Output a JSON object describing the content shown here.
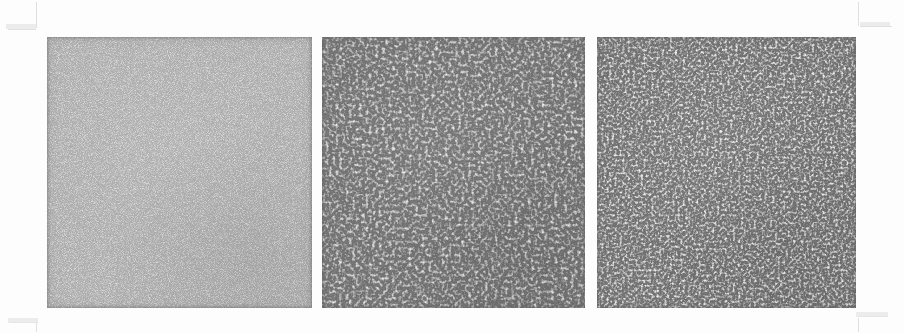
{
  "figure": {
    "background_color": "#fdfdfd",
    "width": 904,
    "height": 333
  },
  "panels": [
    {
      "id": "panel-1",
      "label": "",
      "texture": "fine-speckle-noise",
      "base_color": "#6b6b6b",
      "highlight_color": "#e8e8e8",
      "shadow_color": "#3a3a3a",
      "x": 47,
      "y": 37,
      "width": 265,
      "height": 271,
      "grain_scale": "fine",
      "feature_frequency": 0.62
    },
    {
      "id": "panel-2",
      "label": "",
      "texture": "labyrinthine-worm-pattern",
      "base_color": "#6d6d6d",
      "highlight_color": "#d8d8d8",
      "shadow_color": "#424242",
      "x": 322,
      "y": 37,
      "width": 263,
      "height": 271,
      "grain_scale": "coarse",
      "feature_frequency": 0.3
    },
    {
      "id": "panel-3",
      "label": "",
      "texture": "labyrinthine-worm-pattern",
      "base_color": "#6c6c6c",
      "highlight_color": "#dcdcdc",
      "shadow_color": "#3f3f3f",
      "x": 597,
      "y": 37,
      "width": 259,
      "height": 271,
      "grain_scale": "medium",
      "feature_frequency": 0.38
    }
  ],
  "crop_marks": {
    "color": "#c9c9c9",
    "items": [
      {
        "name": "top-left-vertical",
        "x": 36,
        "y": 2,
        "w": 1,
        "h": 26,
        "orient": "v"
      },
      {
        "name": "top-left-horizontal",
        "x": 8,
        "y": 29,
        "w": 28,
        "h": 1,
        "orient": "h"
      },
      {
        "name": "top-right-vertical",
        "x": 858,
        "y": 2,
        "w": 1,
        "h": 24,
        "orient": "v"
      },
      {
        "name": "top-right-horizontal",
        "x": 860,
        "y": 26,
        "w": 32,
        "h": 1,
        "orient": "h"
      },
      {
        "name": "bottom-left-horizontal",
        "x": 10,
        "y": 322,
        "w": 28,
        "h": 1,
        "orient": "h"
      },
      {
        "name": "bottom-left-vertical",
        "x": 36,
        "y": 322,
        "w": 1,
        "h": 10,
        "orient": "v"
      },
      {
        "name": "bottom-right-horizontal",
        "x": 858,
        "y": 316,
        "w": 30,
        "h": 1,
        "orient": "h"
      },
      {
        "name": "bottom-right-vertical",
        "x": 858,
        "y": 318,
        "w": 1,
        "h": 14,
        "orient": "v"
      }
    ]
  }
}
